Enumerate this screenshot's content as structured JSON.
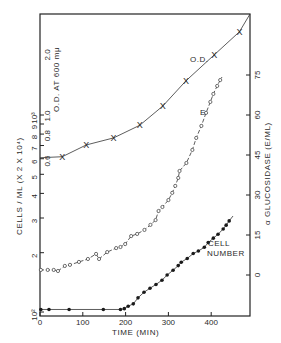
{
  "chart_data": {
    "type": "line",
    "title": "",
    "xlabel": "TIME (MIN)",
    "ylabel_left_cells": "CELLS / ML (X 2 X 10⁴)",
    "ylabel_left_od": "O.D. AT 600 mμ",
    "ylabel_right": "α GLUCOSIDASE (E/ML)",
    "xlim": [
      0,
      490
    ],
    "x_ticks": [
      0,
      100,
      200,
      300,
      400
    ],
    "left_cells_axis": {
      "scale": "log",
      "range": [
        100,
        1300
      ],
      "tick_labels": [
        {
          "label": "10²",
          "value": 100
        },
        {
          "label": "2",
          "value": 200
        },
        {
          "label": "3",
          "value": 300
        },
        {
          "label": "4",
          "value": 400
        },
        {
          "label": "5",
          "value": 500
        },
        {
          "label": "6",
          "value": 600
        },
        {
          "label": "7",
          "value": 700
        },
        {
          "label": "8",
          "value": 800
        },
        {
          "label": "9",
          "value": 900
        },
        {
          "label": "10³",
          "value": 1000
        }
      ]
    },
    "left_od_axis": {
      "scale": "log",
      "tick_labels": [
        {
          "label": "0.6",
          "value": 0.6
        },
        {
          "label": "0.8",
          "value": 0.8
        },
        {
          "label": "1.0",
          "value": 1.0
        },
        {
          "label": "2.0",
          "value": 2.0
        }
      ]
    },
    "right_axis": {
      "scale": "linear",
      "range": [
        -15,
        90
      ],
      "ticks": [
        0,
        15,
        30,
        45,
        60,
        75
      ]
    },
    "grid": false,
    "legend": "inline labels",
    "series": [
      {
        "name": "O.D.",
        "label": "O.D.",
        "axis": "left_od",
        "marker": "x",
        "x": [
          52,
          108,
          172,
          233,
          287,
          341,
          407,
          466
        ],
        "y": [
          0.63,
          0.72,
          0.78,
          0.9,
          1.12,
          1.49,
          2.0,
          2.6
        ]
      },
      {
        "name": "E (α-glucosidase)",
        "label": "E",
        "axis": "right",
        "marker": "open-circle",
        "dashed": true,
        "x": [
          2,
          18,
          32,
          42,
          58,
          70,
          91,
          112,
          131,
          138,
          157,
          178,
          188,
          199,
          213,
          227,
          244,
          258,
          270,
          277,
          286,
          300,
          309,
          316,
          323,
          326,
          342,
          356,
          365,
          377,
          388,
          398,
          405,
          414,
          421
        ],
        "y": [
          1.9,
          1.9,
          1.9,
          1.5,
          3.4,
          3.8,
          4.9,
          6.0,
          7.9,
          6.0,
          8.6,
          10.1,
          10.5,
          11.6,
          14.6,
          15.4,
          16.9,
          18.8,
          20.6,
          24.0,
          25.5,
          28.1,
          30.8,
          33.4,
          36.4,
          39.0,
          42.0,
          46.9,
          51.4,
          55.9,
          60.8,
          64.9,
          67.9,
          70.9,
          73.1
        ]
      },
      {
        "name": "Cell number",
        "label": "CELL NUMBER",
        "axis": "left_cells",
        "marker": "filled-circle",
        "x": [
          2,
          21,
          68,
          148,
          188,
          197,
          206,
          218,
          229,
          243,
          257,
          271,
          285,
          297,
          311,
          323,
          330,
          344,
          358,
          370,
          384,
          393,
          405,
          416,
          428,
          435,
          442
        ],
        "y": [
          103,
          103,
          103,
          103,
          103,
          104,
          107,
          110,
          118,
          126,
          132,
          138,
          145,
          154,
          163,
          172,
          179,
          187,
          198,
          204,
          213,
          225,
          237,
          248,
          264,
          276,
          290
        ]
      }
    ]
  }
}
